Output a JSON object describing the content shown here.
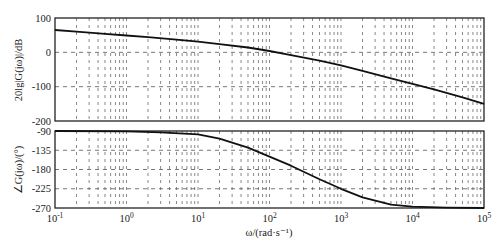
{
  "chart_data": [
    {
      "type": "line",
      "panel": "magnitude",
      "title": "",
      "xlabel": "ω/(rad·s⁻¹)",
      "ylabel": "20lg|G(jω)|/dB",
      "xscale": "log",
      "xlim": [
        0.1,
        100000
      ],
      "ylim": [
        -200,
        100
      ],
      "yticks": [
        100,
        0,
        -100,
        -200
      ],
      "ytick_labels": [
        "100",
        "0",
        "-100",
        "-200"
      ],
      "grid": true,
      "series": [
        {
          "name": "magnitude",
          "x": [
            0.1,
            0.2,
            0.5,
            1,
            2,
            5,
            10,
            20,
            50,
            100,
            200,
            500,
            1000,
            2000,
            5000,
            10000,
            20000,
            50000,
            100000
          ],
          "values": [
            65,
            60,
            54,
            49,
            44,
            37,
            31,
            24,
            14,
            4,
            -8,
            -24,
            -38,
            -54,
            -76,
            -92,
            -108,
            -131,
            -150
          ]
        }
      ]
    },
    {
      "type": "line",
      "panel": "phase",
      "title": "",
      "xlabel": "ω/(rad·s⁻¹)",
      "ylabel": "∠G(jω)/(°)",
      "xscale": "log",
      "xlim": [
        0.1,
        100000
      ],
      "ylim": [
        -270,
        -90
      ],
      "yticks": [
        -90,
        -135,
        -180,
        -225,
        -270
      ],
      "ytick_labels": [
        "-90",
        "-135",
        "-180",
        "-225",
        "-270"
      ],
      "xtick_labels": [
        "10⁻¹",
        "10⁰",
        "10¹",
        "10²",
        "10³",
        "10⁴",
        "10⁵"
      ],
      "grid": true,
      "series": [
        {
          "name": "phase",
          "x": [
            0.1,
            1,
            3,
            10,
            20,
            50,
            100,
            200,
            500,
            1000,
            2000,
            5000,
            10000,
            30000,
            100000
          ],
          "values": [
            -90,
            -91,
            -93,
            -98,
            -108,
            -129,
            -150,
            -171,
            -203,
            -225,
            -245,
            -262,
            -267,
            -269,
            -270
          ]
        }
      ]
    }
  ],
  "labels": {
    "mag_ylabel": "20lg|G(jω)|/dB",
    "phase_ylabel": "∠G(jω)/(°)",
    "xlabel": "ω/(rad·s⁻¹)",
    "x_ticks": [
      {
        "base": "10",
        "exp": "-1"
      },
      {
        "base": "10",
        "exp": "0"
      },
      {
        "base": "10",
        "exp": "1"
      },
      {
        "base": "10",
        "exp": "2"
      },
      {
        "base": "10",
        "exp": "3"
      },
      {
        "base": "10",
        "exp": "4"
      },
      {
        "base": "10",
        "exp": "5"
      }
    ]
  }
}
